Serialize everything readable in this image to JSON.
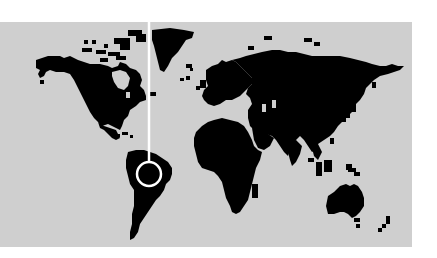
{
  "map": {
    "background_color": "#ffffff",
    "ocean_color": "#cfcfcf",
    "land_color": "#000000",
    "marker_color": "#ffffff",
    "panel": {
      "x": 0,
      "y": 22,
      "width": 412,
      "height": 225
    },
    "marker": {
      "type": "pin-circle",
      "cx": 149,
      "cy": 174,
      "r": 12,
      "line_top": 0,
      "location_region": "South America (northern Brazil / Amazon)"
    },
    "regions": [
      "north-america",
      "greenland",
      "south-america",
      "europe",
      "africa",
      "asia",
      "australia",
      "new-zealand"
    ]
  }
}
